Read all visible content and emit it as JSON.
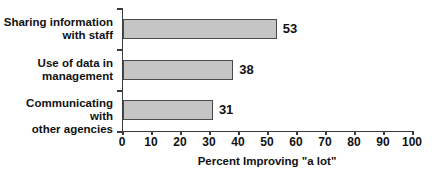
{
  "chart_data": {
    "type": "bar",
    "orientation": "horizontal",
    "categories": [
      "Sharing information with staff",
      "Use of data in management",
      "Communicating with other agencies"
    ],
    "category_lines": [
      [
        "Sharing information",
        "with staff"
      ],
      [
        "Use of data in",
        "management"
      ],
      [
        "Communicating with",
        "other agencies"
      ]
    ],
    "values": [
      53,
      38,
      31
    ],
    "value_labels": [
      "53",
      "38",
      "31"
    ],
    "title": "",
    "xlabel": "Percent Improving \"a lot\"",
    "ylabel": "",
    "xlim": [
      0,
      100
    ],
    "xticks": [
      0,
      10,
      20,
      30,
      40,
      50,
      60,
      70,
      80,
      90,
      100
    ],
    "grid": "off",
    "legend": "none",
    "bar_fill_color": "#c5c5c5",
    "bar_border_color": "#4a4a4a",
    "axis_color": "#3c3c3c",
    "text_color": "#111111"
  }
}
